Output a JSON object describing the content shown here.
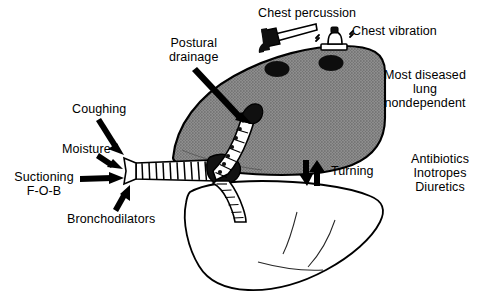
{
  "figure": {
    "background_color": "#ffffff",
    "ink_color": "#000000",
    "diseased_lung_fill": "#8a8a8a",
    "dependent_lung_fill": "#ffffff"
  },
  "labels": {
    "chest_percussion": "Chest percussion",
    "chest_vibration": "Chest vibration",
    "postural_drainage": "Postural\ndrainage",
    "most_diseased_lung": "Most diseased\nlung\nnondependent",
    "coughing": "Coughing",
    "moisture": "Moisture",
    "suctioning_fob": "Suctioning\nF-O-B",
    "bronchodilators": "Bronchodilators",
    "turning": "Turning",
    "drugs": "Antibiotics\nInotropes\nDiuretics"
  },
  "anatomy": {
    "upper_lung": "diseased nondependent lung (shaded)",
    "lower_lung": "dependent lung (outline)",
    "trachea": "trachea with cartilage rings",
    "upper_bronchus": "bronchus to nondependent lung",
    "lower_bronchus": "bronchus to dependent lung",
    "percussion_contact_spot": "dark contact area",
    "vibration_contact_spot": "dark contact area"
  },
  "icons": {
    "hammer": "percussion hammer",
    "vibrator": "chest vibrator device",
    "turning_arrow": "double-headed vertical arrow"
  }
}
